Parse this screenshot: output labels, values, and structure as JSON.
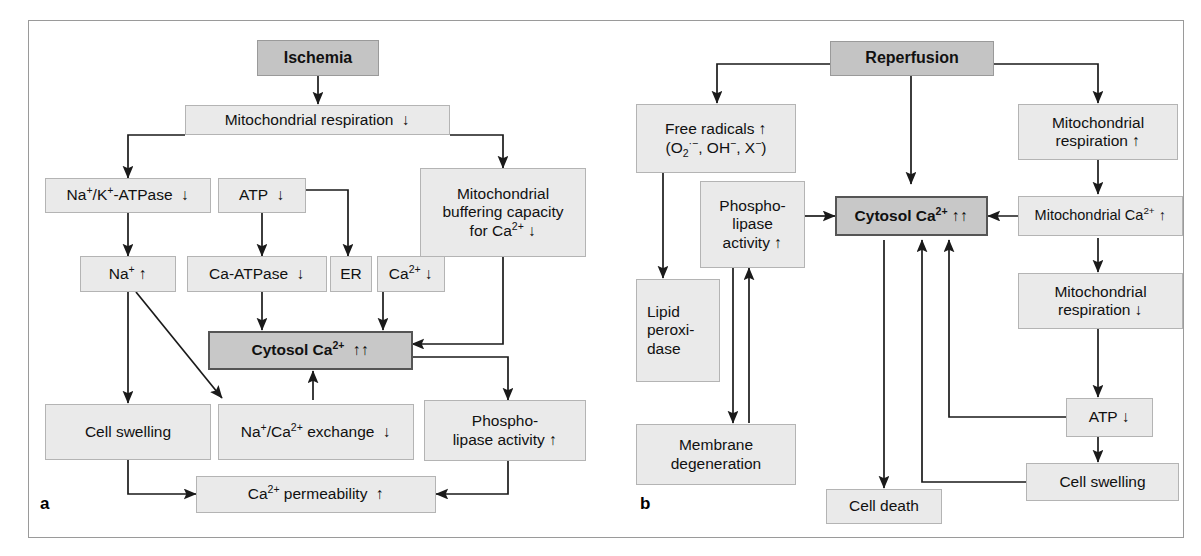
{
  "figure": {
    "type": "two-panel flow diagram",
    "panels": [
      {
        "id": "a",
        "label": "a",
        "title": "Ischemia cascade",
        "nodes": [
          {
            "id": "a-ischemia",
            "label": "Ischemia",
            "style": "header"
          },
          {
            "id": "a-mito-resp",
            "label": "Mitochondrial respiration  ↓",
            "style": "normal"
          },
          {
            "id": "a-nak-atpase",
            "label": "Na⁺/K⁺-ATPase  ↓",
            "style": "normal"
          },
          {
            "id": "a-atp",
            "label": "ATP  ↓",
            "style": "normal"
          },
          {
            "id": "a-mito-buffer",
            "label": "Mitochondrial buffering capacity for Ca²⁺ ↓",
            "style": "normal"
          },
          {
            "id": "a-na",
            "label": "Na⁺ ↑",
            "style": "normal"
          },
          {
            "id": "a-ca-atpase",
            "label": "Ca-ATPase  ↓",
            "style": "normal"
          },
          {
            "id": "a-er",
            "label": "ER",
            "style": "normal"
          },
          {
            "id": "a-ca",
            "label": "Ca²⁺ ↓",
            "style": "normal"
          },
          {
            "id": "a-cytosol",
            "label": "Cytosol Ca²⁺  ↑↑",
            "style": "dark"
          },
          {
            "id": "a-cell-swelling",
            "label": "Cell swelling",
            "style": "normal"
          },
          {
            "id": "a-naca-exchange",
            "label": "Na⁺/Ca²⁺ exchange  ↓",
            "style": "normal"
          },
          {
            "id": "a-phospholipase",
            "label": "Phospho-lipase activity ↑",
            "style": "normal"
          },
          {
            "id": "a-ca-permeability",
            "label": "Ca²⁺ permeability  ↑",
            "style": "normal"
          }
        ],
        "edges": [
          {
            "from": "a-ischemia",
            "to": "a-mito-resp"
          },
          {
            "from": "a-mito-resp",
            "to": "a-nak-atpase"
          },
          {
            "from": "a-mito-resp",
            "to": "a-mito-buffer"
          },
          {
            "from": "a-nak-atpase",
            "to": "a-na"
          },
          {
            "from": "a-atp",
            "to": "a-ca-atpase"
          },
          {
            "from": "a-atp",
            "to": "a-er"
          },
          {
            "from": "a-ca-atpase",
            "to": "a-cytosol"
          },
          {
            "from": "a-ca",
            "to": "a-cytosol"
          },
          {
            "from": "a-mito-buffer",
            "to": "a-cytosol"
          },
          {
            "from": "a-na",
            "to": "a-cell-swelling"
          },
          {
            "from": "a-na",
            "to": "a-naca-exchange"
          },
          {
            "from": "a-naca-exchange",
            "to": "a-cytosol"
          },
          {
            "from": "a-cytosol",
            "to": "a-phospholipase"
          },
          {
            "from": "a-cell-swelling",
            "to": "a-ca-permeability"
          },
          {
            "from": "a-phospholipase",
            "to": "a-ca-permeability"
          }
        ]
      },
      {
        "id": "b",
        "label": "b",
        "title": "Reperfusion cascade",
        "nodes": [
          {
            "id": "b-reperfusion",
            "label": "Reperfusion",
            "style": "header"
          },
          {
            "id": "b-free-radicals",
            "label": "Free radicals ↑ (O₂·⁻, OH⁻, X⁻)",
            "style": "normal"
          },
          {
            "id": "b-mito-resp-up",
            "label": "Mitochondrial respiration ↑",
            "style": "normal"
          },
          {
            "id": "b-phospholipase",
            "label": "Phospho-lipase activity ↑",
            "style": "normal"
          },
          {
            "id": "b-cytosol",
            "label": "Cytosol Ca²⁺  ↑↑",
            "style": "dark"
          },
          {
            "id": "b-mito-ca",
            "label": "Mitochondrial Ca²⁺ ↑",
            "style": "normal"
          },
          {
            "id": "b-lipid-peroxidase",
            "label": "Lipid peroxi-dase",
            "style": "normal"
          },
          {
            "id": "b-mito-resp-down",
            "label": "Mitochondrial respiration ↓",
            "style": "normal"
          },
          {
            "id": "b-membrane-degen",
            "label": "Membrane degeneration",
            "style": "normal"
          },
          {
            "id": "b-atp",
            "label": "ATP ↓",
            "style": "normal"
          },
          {
            "id": "b-cell-swelling",
            "label": "Cell swelling",
            "style": "normal"
          },
          {
            "id": "b-cell-death",
            "label": "Cell death",
            "style": "normal"
          }
        ],
        "edges": [
          {
            "from": "b-reperfusion",
            "to": "b-free-radicals"
          },
          {
            "from": "b-reperfusion",
            "to": "b-cytosol"
          },
          {
            "from": "b-reperfusion",
            "to": "b-mito-resp-up"
          },
          {
            "from": "b-free-radicals",
            "to": "b-lipid-peroxidase"
          },
          {
            "from": "b-phospholipase",
            "to": "b-cytosol"
          },
          {
            "from": "b-phospholipase",
            "to": "b-membrane-degen"
          },
          {
            "from": "b-membrane-degen",
            "to": "b-phospholipase"
          },
          {
            "from": "b-mito-resp-up",
            "to": "b-mito-ca"
          },
          {
            "from": "b-mito-ca",
            "to": "b-cytosol"
          },
          {
            "from": "b-mito-ca",
            "to": "b-mito-resp-down"
          },
          {
            "from": "b-mito-resp-down",
            "to": "b-atp"
          },
          {
            "from": "b-atp",
            "to": "b-cytosol"
          },
          {
            "from": "b-atp",
            "to": "b-cell-swelling"
          },
          {
            "from": "b-cell-swelling",
            "to": "b-cytosol"
          },
          {
            "from": "b-cytosol",
            "to": "b-cell-death"
          }
        ]
      }
    ]
  },
  "a": {
    "label": "a",
    "ischemia": "Ischemia",
    "mito_resp_pre": "Mitochondrial respiration",
    "mito_resp_arrow": "↓",
    "nak_atpase_arrow": "↓",
    "atp_pre": "ATP",
    "atp_arrow": "↓",
    "mito_buffer_l1": "Mitochondrial",
    "mito_buffer_l2": "buffering capacity",
    "mito_buffer_l3_pre": "for Ca",
    "mito_buffer_arrow": "↓",
    "na_arrow": "↑",
    "ca_atpase_pre": "Ca-ATPase",
    "ca_atpase_arrow": "↓",
    "er": "ER",
    "ca_arrow": "↓",
    "cytosol_pre": "Cytosol Ca",
    "cytosol_arrows": "↑↑",
    "cell_swelling": "Cell swelling",
    "naca_arrow": "↓",
    "phospho_l1": "Phospho-",
    "phospho_l2_pre": "lipase activity",
    "phospho_arrow": "↑",
    "ca_perm_pre": " permeability",
    "ca_perm_arrow": "↑"
  },
  "b": {
    "label": "b",
    "reperfusion": "Reperfusion",
    "free_radicals_l1_pre": "Free radicals",
    "free_radicals_arrow": "↑",
    "mito_resp_up_l1": "Mitochondrial",
    "mito_resp_up_l2_pre": "respiration",
    "mito_resp_up_arrow": "↑",
    "phospho_l1": "Phospho-",
    "phospho_l2": "lipase",
    "phospho_l3_pre": "activity",
    "phospho_arrow": "↑",
    "cytosol_pre": "Cytosol Ca",
    "cytosol_arrows": "↑↑",
    "mito_ca_pre": "Mitochondrial Ca",
    "mito_ca_arrow": "↑",
    "lipid_l1": "Lipid",
    "lipid_l2": "peroxi-",
    "lipid_l3": "dase",
    "mito_resp_dn_l1": "Mitochondrial",
    "mito_resp_dn_l2_pre": "respiration",
    "mito_resp_dn_arrow": "↓",
    "membrane_l1": "Membrane",
    "membrane_l2": "degeneration",
    "atp_pre": "ATP",
    "atp_arrow": "↓",
    "cell_swelling": "Cell swelling",
    "cell_death": "Cell death"
  },
  "colors": {
    "box_fill": "#eaeaea",
    "box_border": "#b4b4b4",
    "header_fill": "#c4c4c4",
    "emphasis_fill": "#c8c8c8",
    "emphasis_border": "#555555",
    "frame_border": "#9a9a9a",
    "line": "#1a1a1a",
    "background": "#ffffff"
  }
}
